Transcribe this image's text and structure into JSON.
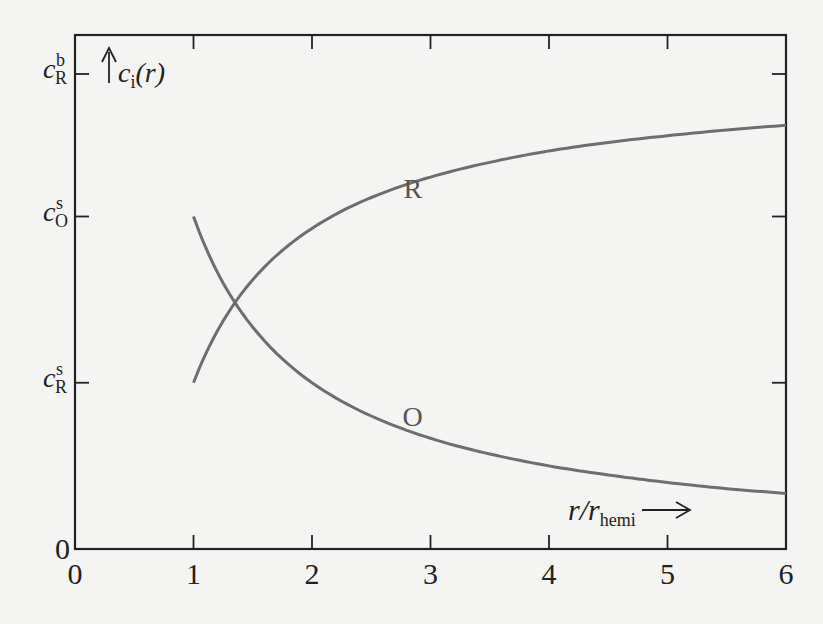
{
  "chart_data": {
    "type": "line",
    "title": "",
    "xlabel": "r/r_hemi",
    "xlabel_main": "r/r",
    "xlabel_sub": "hemi",
    "ylabel": "c_i(r)",
    "ylabel_main": "c",
    "ylabel_sub": "i",
    "ylabel_tail": "(r)",
    "xlim": [
      0,
      6
    ],
    "ylim": [
      0,
      1.1
    ],
    "x_ticks": [
      0,
      1,
      2,
      3,
      4,
      5,
      6
    ],
    "x_tick_labels": [
      "0",
      "1",
      "2",
      "3",
      "4",
      "5",
      "6"
    ],
    "y_ticks": [
      {
        "value": 0,
        "main": "0",
        "sub": "",
        "sup": ""
      },
      {
        "value": 0.35,
        "main": "c",
        "sub": "R",
        "sup": "s"
      },
      {
        "value": 0.7,
        "main": "c",
        "sub": "O",
        "sup": "s"
      },
      {
        "value": 1.0,
        "main": "c",
        "sub": "R",
        "sup": "b"
      }
    ],
    "grid": false,
    "legend": "none (inline labels)",
    "series": [
      {
        "name": "R",
        "label": "R",
        "label_at": [
          2.85,
          0.74
        ],
        "x": [
          1,
          1.25,
          1.5,
          2,
          2.5,
          3,
          3.5,
          4,
          4.5,
          5,
          5.5,
          6
        ],
        "values": [
          0.35,
          0.48,
          0.567,
          0.675,
          0.74,
          0.783,
          0.814,
          0.838,
          0.856,
          0.87,
          0.882,
          0.892
        ]
      },
      {
        "name": "O",
        "label": "O",
        "label_at": [
          2.85,
          0.26
        ],
        "x": [
          1,
          1.25,
          1.5,
          2,
          2.5,
          3,
          3.5,
          4,
          4.5,
          5,
          5.5,
          6
        ],
        "values": [
          0.7,
          0.56,
          0.467,
          0.35,
          0.28,
          0.233,
          0.2,
          0.175,
          0.156,
          0.14,
          0.127,
          0.117
        ]
      }
    ],
    "annotations": [
      "x-axis arrow →",
      "y-axis arrow ↑"
    ],
    "colors": {
      "axes": "#222222",
      "curves": "#6e6e6e",
      "background": "#f4f4f2"
    }
  }
}
